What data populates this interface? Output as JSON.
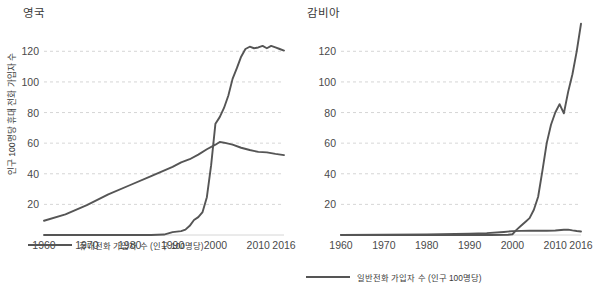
{
  "chart_data": [
    {
      "type": "line",
      "title": "영국",
      "xlabel": "",
      "ylabel": "인구 100명당 휴대 전화 가입자 수",
      "xlim": [
        1960,
        2016
      ],
      "ylim": [
        0,
        130
      ],
      "xticks": [
        1960,
        1970,
        1980,
        1990,
        2000,
        2010,
        2016
      ],
      "yticks": [
        20,
        40,
        60,
        80,
        100,
        120
      ],
      "grid": true,
      "legend_position": "bottom",
      "series": [
        {
          "name": "휴대전화 가입자 수 (인구 100명당)",
          "color": "#555555",
          "x": [
            1960,
            1965,
            1970,
            1975,
            1980,
            1985,
            1988,
            1990,
            1991,
            1992,
            1993,
            1994,
            1995,
            1996,
            1997,
            1998,
            1999,
            2000,
            2001,
            2002,
            2003,
            2004,
            2005,
            2006,
            2007,
            2008,
            2009,
            2010,
            2011,
            2012,
            2013,
            2014,
            2015,
            2016
          ],
          "values": [
            0,
            0,
            0,
            0,
            0,
            0,
            0.3,
            1.9,
            2.2,
            2.5,
            3.5,
            6.0,
            9.8,
            11.7,
            15.0,
            24.7,
            45.6,
            72.7,
            77.0,
            83.0,
            91.0,
            102.0,
            109.0,
            116.5,
            121.5,
            123.0,
            122.0,
            122.5,
            123.5,
            122.0,
            123.5,
            122.5,
            121.5,
            120.5
          ]
        },
        {
          "name": "일반전화 가입자 수 (인구 100명당)",
          "color": "#555555",
          "x": [
            1960,
            1965,
            1970,
            1975,
            1980,
            1985,
            1990,
            1992,
            1994,
            1996,
            1998,
            2000,
            2001,
            2002,
            2004,
            2006,
            2008,
            2010,
            2012,
            2014,
            2016
          ],
          "values": [
            9.3,
            13.5,
            19.5,
            26.5,
            32.5,
            38.5,
            44.5,
            47.5,
            49.5,
            52.5,
            56.0,
            59.0,
            60.8,
            60.3,
            59.0,
            57.0,
            55.5,
            54.3,
            54.0,
            53.0,
            52.2
          ]
        }
      ]
    },
    {
      "type": "line",
      "title": "감비아",
      "xlabel": "",
      "ylabel": "",
      "xlim": [
        1960,
        2016
      ],
      "ylim": [
        0,
        130
      ],
      "xticks": [
        1960,
        1970,
        1980,
        1990,
        2000,
        2010,
        2016
      ],
      "yticks": [
        20,
        40,
        60,
        80,
        100,
        120
      ],
      "grid": true,
      "legend_position": "bottom",
      "series": [
        {
          "name": "휴대전화 가입자 수 (인구 100명당)",
          "color": "#555555",
          "x": [
            1960,
            1970,
            1980,
            1990,
            1995,
            1999,
            2000,
            2001,
            2002,
            2003,
            2004,
            2005,
            2006,
            2007,
            2008,
            2009,
            2010,
            2011,
            2012,
            2013,
            2014,
            2015,
            2016
          ],
          "values": [
            0,
            0,
            0,
            0,
            0,
            0.2,
            0.5,
            3.5,
            6.0,
            8.5,
            11.0,
            16.5,
            25.0,
            42.0,
            60.0,
            72.0,
            80.0,
            85.5,
            79.5,
            93.5,
            105.0,
            120.0,
            138.0
          ]
        },
        {
          "name": "일반전화 가입자 수 (인구 100명당)",
          "color": "#555555",
          "x": [
            1960,
            1970,
            1980,
            1990,
            1994,
            1998,
            2000,
            2002,
            2004,
            2006,
            2008,
            2010,
            2012,
            2013,
            2014,
            2015,
            2016
          ],
          "values": [
            0.1,
            0.2,
            0.4,
            0.8,
            1.2,
            2.0,
            2.5,
            2.7,
            2.8,
            2.8,
            2.8,
            2.9,
            3.4,
            3.5,
            3.0,
            2.6,
            2.3
          ]
        }
      ]
    }
  ],
  "legends": [
    {
      "label": "휴대전화 가입자 수 (인구 100명당)",
      "color": "#555555"
    },
    {
      "label": "일반전화 가입자 수 (인구 100명당)",
      "color": "#555555"
    }
  ]
}
